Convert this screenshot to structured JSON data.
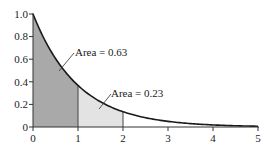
{
  "chart_data": {
    "type": "area",
    "title": "",
    "xlabel": "",
    "ylabel": "",
    "function": "y = e^(-x)",
    "xlim": [
      0,
      5
    ],
    "ylim": [
      0,
      1.0
    ],
    "grid": false,
    "x_ticks": [
      "0",
      "1",
      "2",
      "3",
      "4",
      "5"
    ],
    "y_ticks": [
      "0",
      "0.2",
      "0.4",
      "0.6",
      "0.8",
      "1.0"
    ],
    "curve": {
      "x": [
        0,
        0.25,
        0.5,
        0.75,
        1,
        1.5,
        2,
        2.5,
        3,
        3.5,
        4,
        4.5,
        5
      ],
      "y": [
        1.0,
        0.779,
        0.607,
        0.472,
        0.368,
        0.223,
        0.135,
        0.082,
        0.05,
        0.03,
        0.018,
        0.011,
        0.007
      ]
    },
    "shaded_regions": [
      {
        "from": 0,
        "to": 1,
        "area": 0.63,
        "label": "Area = 0.63",
        "color": "#a9a9a9"
      },
      {
        "from": 1,
        "to": 2,
        "area": 0.23,
        "label": "Area = 0.23",
        "color": "#e3e3e3"
      }
    ],
    "colors": {
      "curve": "#1a1a1a",
      "axis": "#333333"
    }
  },
  "labels": {
    "area1": "Area = 0.63",
    "area2": "Area = 0.23"
  },
  "ticks": {
    "x0": "0",
    "x1": "1",
    "x2": "2",
    "x3": "3",
    "x4": "4",
    "x5": "5",
    "y0": "0",
    "y1": "0.2",
    "y2": "0.4",
    "y3": "0.6",
    "y4": "0.8",
    "y5": "1.0"
  }
}
